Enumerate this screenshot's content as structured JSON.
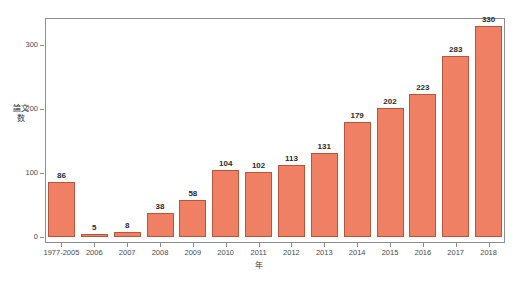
{
  "figure": {
    "caption_strip": "",
    "background_color": "#ffffff",
    "frame_color": "#8e8e8e"
  },
  "chart_data": {
    "type": "bar",
    "title": "",
    "xlabel": "年",
    "ylabel": "論文数",
    "categories": [
      "1977-2005",
      "2006",
      "2007",
      "2008",
      "2009",
      "2010",
      "2011",
      "2012",
      "2013",
      "2014",
      "2015",
      "2016",
      "2017",
      "2018"
    ],
    "values": [
      86,
      5,
      8,
      38,
      58,
      104,
      102,
      113,
      131,
      179,
      202,
      223,
      283,
      330
    ],
    "value_labels": [
      "86",
      "5",
      "8",
      "38",
      "58",
      "104",
      "102",
      "113",
      "131",
      "179",
      "202",
      "223",
      "283",
      "330"
    ],
    "ylim": [
      0,
      345
    ],
    "yticks": [
      0,
      100,
      200,
      300
    ],
    "ytick_labels": [
      "0",
      "100",
      "200",
      "300"
    ],
    "grid": false,
    "legend": false,
    "bar_color": "#F08063",
    "bar_border_color": "#b5573f"
  }
}
